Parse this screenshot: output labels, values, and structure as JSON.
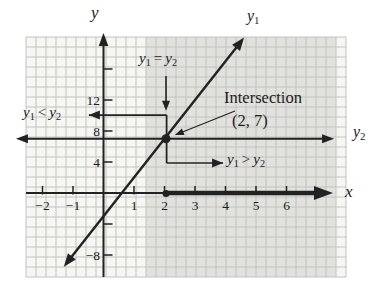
{
  "labels": {
    "y_axis": "y",
    "x_axis": "x",
    "y1": {
      "base": "y",
      "sub": "1"
    },
    "y2": {
      "base": "y",
      "sub": "2"
    },
    "eq": {
      "a": "y",
      "a_sub": "1",
      "op": "=",
      "b": "y",
      "b_sub": "2"
    },
    "lt": {
      "a": "y",
      "a_sub": "1",
      "op": "<",
      "b": "y",
      "b_sub": "2"
    },
    "gt": {
      "a": "y",
      "a_sub": "1",
      "op": ">",
      "b": "y",
      "b_sub": "2"
    },
    "intersection_title": "Intersection",
    "intersection_point": "(2, 7)"
  },
  "chart_data": {
    "type": "line",
    "title": "",
    "xlabel": "x",
    "ylabel": "y",
    "xlim": [
      -2.6,
      8.0
    ],
    "ylim": [
      -10.9,
      20.4
    ],
    "grid": true,
    "series": [
      {
        "name": "y1",
        "equation": "y1 = 5x - 3",
        "slope": 5,
        "intercept": -3,
        "x_range": [
          -1.3,
          4.61
        ],
        "arrows": "both"
      },
      {
        "name": "y2",
        "equation": "y2 = 7",
        "value": 7,
        "x_range": [
          -2.87,
          7.56
        ],
        "arrows": "both"
      }
    ],
    "intersection": {
      "x": 2,
      "y": 7,
      "label": "(2, 7)"
    },
    "x_ticks": [
      {
        "value": -2,
        "label": "−2"
      },
      {
        "value": -1,
        "label": "−1"
      },
      {
        "value": 1,
        "label": "1"
      },
      {
        "value": 2,
        "label": "2"
      },
      {
        "value": 3,
        "label": "3"
      },
      {
        "value": 4,
        "label": "4"
      },
      {
        "value": 5,
        "label": "5"
      },
      {
        "value": 6,
        "label": "6"
      }
    ],
    "y_ticks": [
      {
        "value": 16,
        "label": ""
      },
      {
        "value": 12,
        "label": "12"
      },
      {
        "value": 8,
        "label": "8"
      },
      {
        "value": 4,
        "label": "4"
      },
      {
        "value": -4,
        "label": ""
      },
      {
        "value": -8,
        "label": "−8"
      }
    ],
    "shaded_region": {
      "x_start": 1.39,
      "x_end": 7.62
    },
    "annotations": {
      "down_arrow": {
        "from": [
          2.05,
          15.1
        ],
        "to": [
          2.05,
          10.6
        ]
      },
      "lt_bracket": {
        "points": [
          [
            -0.48,
            10.06
          ],
          [
            2.07,
            10.06
          ],
          [
            2.07,
            7.0
          ]
        ],
        "arrow": "start"
      },
      "gt_bracket": {
        "points": [
          [
            2.07,
            7.0
          ],
          [
            2.07,
            3.87
          ],
          [
            3.92,
            3.87
          ]
        ],
        "arrow": "end"
      },
      "pointer": {
        "from": [
          4.31,
          10.58
        ],
        "to": [
          2.34,
          7.48
        ]
      },
      "x_axis_dot": [
        2.05,
        0
      ],
      "bold_x_segment": {
        "from": 2.05,
        "to": 6.95
      }
    },
    "colors": {
      "ink": "#222222",
      "grid_line": "#c2c2bf",
      "plot_bg": "#f6f6f3",
      "shaded_bg": "#e1e1de"
    }
  }
}
